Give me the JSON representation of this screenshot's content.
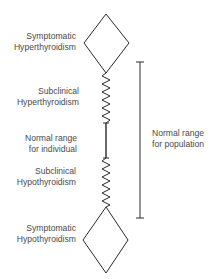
{
  "diagram": {
    "type": "thyroid-function-spectrum",
    "colors": {
      "line": "#2a2a2a",
      "text": "#4a4a4a",
      "background": "#ffffff"
    },
    "states": [
      {
        "id": "symptomatic-hyperthyroidism",
        "shape": "diamond",
        "line1": "Symptomatic",
        "line2": "Hyperthyroidism"
      },
      {
        "id": "subclinical-hyperthyroidism",
        "shape": "zigzag",
        "line1": "Subclinical",
        "line2": "Hyperthyroidism"
      },
      {
        "id": "normal-range-individual",
        "shape": "straight-line",
        "line1": "Normal range",
        "line2": "for individual"
      },
      {
        "id": "subclinical-hypothyroidism",
        "shape": "zigzag",
        "line1": "Subclinical",
        "line2": "Hypothyroidism"
      },
      {
        "id": "symptomatic-hypothyroidism",
        "shape": "diamond",
        "line1": "Symptomatic",
        "line2": "Hypothyroidism"
      }
    ],
    "population_range": {
      "shape": "bracket",
      "line1": "Normal range",
      "line2": "for population"
    }
  }
}
